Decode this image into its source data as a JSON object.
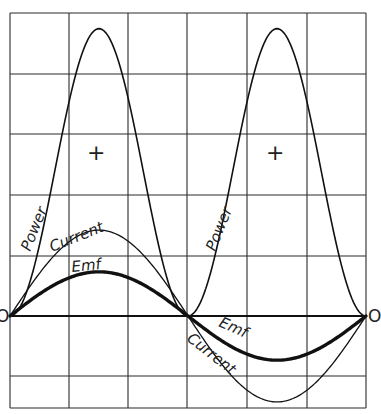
{
  "chart_data": {
    "type": "line",
    "title": "",
    "xlabel": "",
    "ylabel": "",
    "grid": true,
    "legend_position": "none",
    "x_range_cycles": [
      0,
      1
    ],
    "axis_origin_labels": [
      "O",
      "O"
    ],
    "sign_markers": [
      "+",
      "+"
    ],
    "series": [
      {
        "name": "Power",
        "label": "Power",
        "shape": "sin^2 (always positive, double frequency)",
        "peak_relative": 4.75,
        "stroke_width": 1.6
      },
      {
        "name": "Current",
        "label": "Current",
        "shape": "sin",
        "peak_relative": 1.42,
        "stroke_width": 1.4
      },
      {
        "name": "Emf",
        "label": "Emf",
        "shape": "sin (in phase with current)",
        "peak_relative": 0.73,
        "stroke_width": 3.2
      }
    ],
    "grid_cells": {
      "columns": 6,
      "rows_above_axis": 5,
      "rows_below_axis": 1.5
    }
  },
  "labels": {
    "power_left": "Power",
    "power_right": "Power",
    "current_left": "Current",
    "current_right": "Current",
    "emf_left": "Emf",
    "emf_right": "Emf",
    "origin_left": "O",
    "origin_right": "O",
    "plus_left": "+",
    "plus_right": "+"
  }
}
